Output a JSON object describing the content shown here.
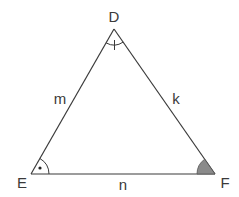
{
  "diagram": {
    "type": "triangle",
    "vertices": [
      {
        "name": "D",
        "x": 114,
        "y": 29,
        "label_x": 114,
        "label_y": 22
      },
      {
        "name": "E",
        "x": 31,
        "y": 174,
        "label_x": 22,
        "label_y": 188
      },
      {
        "name": "F",
        "x": 215,
        "y": 174,
        "label_x": 225,
        "label_y": 188
      }
    ],
    "sides": [
      {
        "name": "m",
        "between": "D-E",
        "label_x": 60,
        "label_y": 104
      },
      {
        "name": "k",
        "between": "D-F",
        "label_x": 176,
        "label_y": 104
      },
      {
        "name": "n",
        "between": "E-F",
        "label_x": 123,
        "label_y": 190
      }
    ],
    "angle_markers": [
      {
        "vertex": "D",
        "style": "arc-with-tick"
      },
      {
        "vertex": "E",
        "style": "arc-with-dot"
      },
      {
        "vertex": "F",
        "style": "filled-sector",
        "fill": "#888888"
      }
    ],
    "line_color": "#3a3a3a"
  }
}
